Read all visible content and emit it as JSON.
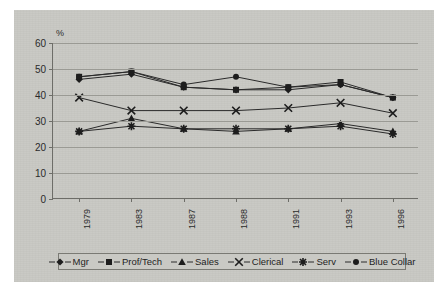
{
  "chart_data": {
    "type": "line",
    "title": "",
    "xlabel": "",
    "ylabel": "%",
    "ylim": [
      0,
      60
    ],
    "ytick_step": 10,
    "yticks": [
      "0",
      "10",
      "20",
      "30",
      "40",
      "50",
      "60"
    ],
    "grid": true,
    "legend_position": "bottom",
    "categories": [
      "1979",
      "1983",
      "1987",
      "1988",
      "1991",
      "1993",
      "1996"
    ],
    "series": [
      {
        "name": "Mgr",
        "marker": "diamond",
        "values": [
          46,
          48,
          43,
          42,
          42,
          44,
          39
        ]
      },
      {
        "name": "Prof/Tech",
        "marker": "square",
        "values": [
          47,
          49,
          43,
          42,
          43,
          45,
          39
        ]
      },
      {
        "name": "Sales",
        "marker": "triangle",
        "values": [
          26,
          31,
          27,
          26,
          27,
          29,
          26
        ]
      },
      {
        "name": "Clerical",
        "marker": "x",
        "values": [
          39,
          34,
          34,
          34,
          35,
          37,
          33
        ]
      },
      {
        "name": "Serv",
        "marker": "asterisk",
        "values": [
          26,
          28,
          27,
          27,
          27,
          28,
          25
        ]
      },
      {
        "name": "Blue Collar",
        "marker": "circle",
        "values": [
          47,
          49,
          44,
          47,
          43,
          44,
          39
        ]
      }
    ]
  },
  "colors": {
    "canvas_background": "#c9c9c4",
    "page_background": "#ffffff",
    "gridline": "#9a9a94",
    "axis": "#6d6d68",
    "series_ink": "#1d1d1d",
    "text": "#2b2b2b"
  }
}
